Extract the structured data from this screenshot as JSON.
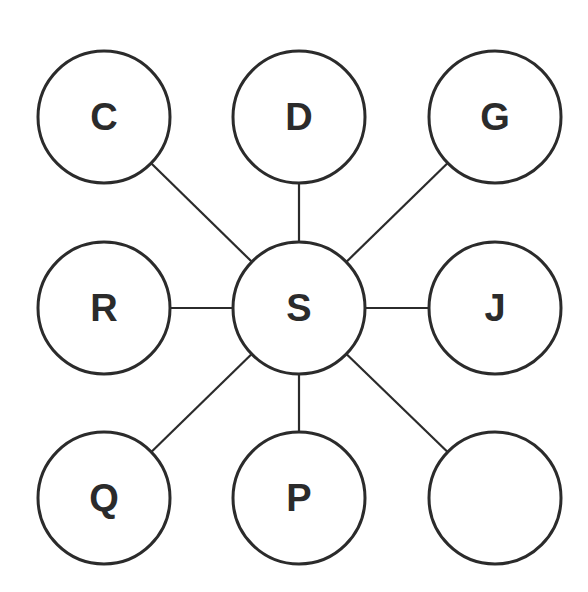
{
  "diagram": {
    "type": "star-graph",
    "stroke_color": "#2b2b2b",
    "center": {
      "id": "S",
      "label": "S",
      "cx": 299,
      "cy": 308
    },
    "nodes": [
      {
        "id": "C",
        "label": "C",
        "cx": 104,
        "cy": 117
      },
      {
        "id": "D",
        "label": "D",
        "cx": 299,
        "cy": 117
      },
      {
        "id": "G",
        "label": "G",
        "cx": 495,
        "cy": 117
      },
      {
        "id": "R",
        "label": "R",
        "cx": 104,
        "cy": 308
      },
      {
        "id": "J",
        "label": "J",
        "cx": 495,
        "cy": 308
      },
      {
        "id": "Q",
        "label": "Q",
        "cx": 104,
        "cy": 498
      },
      {
        "id": "P",
        "label": "P",
        "cx": 299,
        "cy": 498
      },
      {
        "id": "blank",
        "label": "",
        "cx": 495,
        "cy": 498
      }
    ],
    "edges": [
      [
        "S",
        "C"
      ],
      [
        "S",
        "D"
      ],
      [
        "S",
        "G"
      ],
      [
        "S",
        "R"
      ],
      [
        "S",
        "J"
      ],
      [
        "S",
        "Q"
      ],
      [
        "S",
        "P"
      ],
      [
        "S",
        "blank"
      ]
    ],
    "radius": 66
  }
}
